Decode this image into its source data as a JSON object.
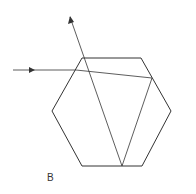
{
  "diagram": {
    "label": "B",
    "colors": {
      "stroke": "#333333",
      "background": "#ffffff"
    }
  }
}
